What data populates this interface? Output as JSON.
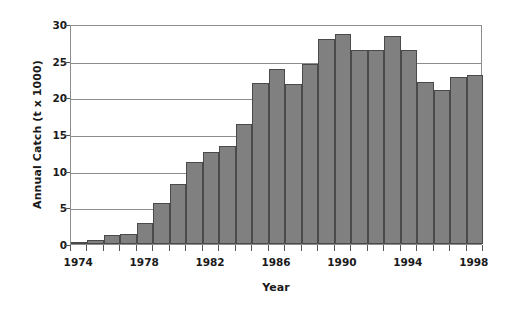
{
  "chart_data": {
    "type": "bar",
    "title": "",
    "xlabel": "Year",
    "ylabel": "Annual Catch (t x 1000)",
    "categories": [
      1974,
      1975,
      1976,
      1977,
      1978,
      1979,
      1980,
      1981,
      1982,
      1983,
      1984,
      1985,
      1986,
      1987,
      1988,
      1989,
      1990,
      1991,
      1992,
      1993,
      1994,
      1995,
      1996,
      1997,
      1998
    ],
    "values": [
      0.3,
      0.6,
      1.2,
      1.3,
      2.9,
      5.6,
      8.2,
      11.2,
      12.5,
      13.3,
      16.4,
      22.0,
      23.8,
      21.8,
      24.5,
      27.9,
      28.7,
      26.5,
      26.5,
      28.4,
      26.4,
      22.1,
      21.0,
      22.8,
      23.1
    ],
    "ylim": [
      0,
      30
    ],
    "xlim": [
      1974,
      1998
    ],
    "ytick_values": [
      0,
      5,
      10,
      15,
      20,
      25,
      30
    ],
    "ytick_labels": [
      "0",
      "5",
      "10",
      "15",
      "20",
      "25",
      "30"
    ],
    "xtick_labels": [
      "1974",
      "1978",
      "1982",
      "1986",
      "1990",
      "1994",
      "1998"
    ],
    "xtick_values": [
      1974,
      1978,
      1982,
      1986,
      1990,
      1994,
      1998
    ],
    "grid": true,
    "legend": false,
    "series_name": "Annual Catch",
    "bar_color": "#808080",
    "bar_edge_color": "#4a4a4a",
    "grid_color": "#8c8c8c",
    "axis_color": "#8c8c8c",
    "text_color": "#1a1a1a",
    "background": "#ffffff"
  }
}
